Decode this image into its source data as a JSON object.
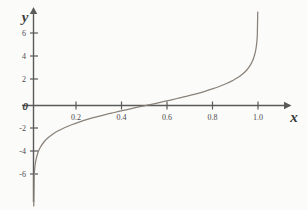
{
  "figure": {
    "background_color": "#fbfbfa",
    "axis_color": "#5a5a5a",
    "curve_color": "#8a8279",
    "text_color": "#3a3a3a"
  },
  "axes": {
    "x_axis_label": "x",
    "y_axis_label": "y",
    "origin_label": "0"
  },
  "chart_data": {
    "type": "line",
    "title": "",
    "subtitle": "",
    "xlabel": "x",
    "ylabel": "y",
    "xlim": [
      -0.04,
      1.12
    ],
    "ylim": [
      -8.2,
      7.6
    ],
    "grid": false,
    "legend": null,
    "x_ticks": [
      0.2,
      0.4,
      0.6,
      0.8,
      1.0
    ],
    "x_tick_labels": [
      "0.2",
      "0.4",
      "0.6",
      "0.8",
      "1.0"
    ],
    "y_ticks": [
      -6,
      -4,
      -2,
      0,
      2,
      4,
      6
    ],
    "y_tick_labels": [
      "-6",
      "-4",
      "-2",
      "0",
      "2",
      "4",
      "6"
    ],
    "y_tick_labels_drawn": [
      "6",
      "4",
      "2",
      "0",
      "-2",
      "-4",
      "-6"
    ],
    "annotations": [
      "vertical asymptote at x = 0",
      "vertical asymptote at x = 1",
      "zero crossing at x = 0.5"
    ],
    "series": [
      {
        "name": "logit",
        "function": "y = ln(x / (1 - x))",
        "x": [
          0.003,
          0.005,
          0.008,
          0.012,
          0.018,
          0.025,
          0.035,
          0.05,
          0.07,
          0.09,
          0.11,
          0.14,
          0.17,
          0.2,
          0.24,
          0.28,
          0.32,
          0.36,
          0.4,
          0.44,
          0.48,
          0.5,
          0.52,
          0.56,
          0.6,
          0.64,
          0.68,
          0.72,
          0.76,
          0.8,
          0.83,
          0.86,
          0.89,
          0.91,
          0.93,
          0.95,
          0.965,
          0.975,
          0.982,
          0.988,
          0.992,
          0.995,
          0.997
        ],
        "y": [
          -5.81,
          -5.29,
          -4.82,
          -4.41,
          -3.99,
          -3.66,
          -3.32,
          -2.94,
          -2.59,
          -2.31,
          -2.09,
          -1.82,
          -1.59,
          -1.39,
          -1.15,
          -0.94,
          -0.75,
          -0.58,
          -0.41,
          -0.24,
          -0.08,
          0.0,
          0.08,
          0.24,
          0.41,
          0.58,
          0.75,
          0.94,
          1.15,
          1.39,
          1.59,
          1.82,
          2.09,
          2.31,
          2.59,
          2.94,
          3.32,
          3.66,
          4.01,
          4.41,
          4.82,
          5.29,
          5.81
        ]
      }
    ]
  }
}
